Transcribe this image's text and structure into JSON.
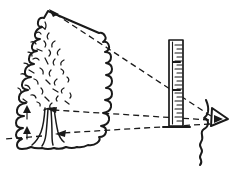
{
  "diagram": {
    "title": "Tree height measurement by sighting over a graduated stick",
    "background_color": "#ffffff",
    "ink_color": "#1a1a1a",
    "style": "hand-drawn line sketch",
    "width": 231,
    "height": 172
  },
  "figures": {
    "tree": {
      "name": "tree",
      "label": "",
      "crown_description": "scalloped wavy conifer-like crown with scattered short interior strokes",
      "trunk_description": "multiple curved vertical trunk lines flaring outward at the base",
      "crown_apex": {
        "x": 48,
        "y": 10
      },
      "base": {
        "x": 47,
        "y": 145
      }
    },
    "measuring_stick": {
      "name": "measuring-stick",
      "label": "",
      "description": "vertical graduated ruler with tick marks along its right inner edge, standing on a small foot",
      "top": {
        "x": 176,
        "y": 40
      },
      "bottom": {
        "x": 176,
        "y": 128
      },
      "tick_count": 22
    },
    "observer": {
      "name": "observer",
      "label": "",
      "description": "profile of a human face with a triangular eye, looking left toward the tree",
      "eye": {
        "x": 213,
        "y": 118
      }
    }
  },
  "sight_lines": [
    {
      "name": "sight-line-to-treetop",
      "label": "",
      "style": "dashed",
      "from": {
        "x": 211,
        "y": 116
      },
      "to": {
        "x": 51,
        "y": 12
      },
      "arrow_at": "to"
    },
    {
      "name": "sight-line-to-crown-base",
      "label": "",
      "style": "dashed",
      "from": {
        "x": 209,
        "y": 120
      },
      "to": {
        "x": 50,
        "y": 110
      },
      "arrow_at": "to"
    },
    {
      "name": "sight-line-to-tree-base",
      "label": "",
      "style": "dashed",
      "from": {
        "x": 210,
        "y": 124
      },
      "to": {
        "x": 8,
        "y": 138
      },
      "arrow_at": "to"
    }
  ],
  "markers": [
    {
      "name": "height-marker-upper",
      "label": "",
      "x": 26,
      "y": 112,
      "direction": "up"
    },
    {
      "name": "height-marker-lower",
      "label": "",
      "x": 26,
      "y": 133,
      "direction": "up"
    }
  ]
}
